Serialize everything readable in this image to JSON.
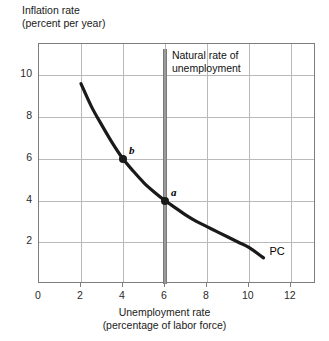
{
  "chart_data": {
    "type": "line",
    "title": "",
    "ylabel_line1": "Inflation rate",
    "ylabel_line2": "(percent per year)",
    "xlabel_line1": "Unemployment rate",
    "xlabel_line2": "(percentage of labor force)",
    "xlim": [
      0,
      13.2
    ],
    "ylim": [
      0,
      11.5
    ],
    "xticks": [
      0,
      2,
      4,
      6,
      8,
      10,
      12
    ],
    "xtick_labels": [
      "0",
      "2",
      "4",
      "6",
      "8",
      "10",
      "12"
    ],
    "yticks": [
      2,
      4,
      6,
      8,
      10
    ],
    "ytick_labels": [
      "2",
      "4",
      "6",
      "8",
      "10"
    ],
    "grid": true,
    "grid_x": [
      2,
      4,
      6,
      8,
      10,
      12
    ],
    "grid_y": [
      2,
      4,
      6,
      8,
      10
    ],
    "legend": "none",
    "series": [
      {
        "name": "PC",
        "label": "PC",
        "color": "#1a1a1a",
        "x": [
          2.0,
          2.5,
          3.0,
          3.5,
          4.0,
          4.5,
          5.0,
          5.5,
          6.0,
          6.5,
          7.0,
          7.5,
          8.0,
          8.5,
          9.0,
          9.5,
          10.0,
          10.7
        ],
        "y": [
          9.6,
          8.5,
          7.6,
          6.75,
          6.0,
          5.4,
          4.85,
          4.4,
          4.0,
          3.65,
          3.3,
          3.0,
          2.75,
          2.5,
          2.25,
          2.0,
          1.75,
          1.25
        ]
      }
    ],
    "points": [
      {
        "id": "b",
        "label": "b",
        "x": 4,
        "y": 6
      },
      {
        "id": "a",
        "label": "a",
        "x": 6,
        "y": 4
      }
    ],
    "annotations": [
      {
        "id": "natural-rate",
        "label_line1": "Natural rate of",
        "label_line2": "unemployment",
        "type": "vline",
        "x": 6,
        "color": "#9a9a9a"
      }
    ],
    "curve_label": "PC",
    "colors": {
      "curve": "#1a1a1a",
      "grid": "#b9b9b9",
      "frame": "#7d7d7d",
      "natural_rate_bar": "#9a9a9a",
      "text": "#1a1a1a",
      "background": "#ffffff"
    }
  }
}
